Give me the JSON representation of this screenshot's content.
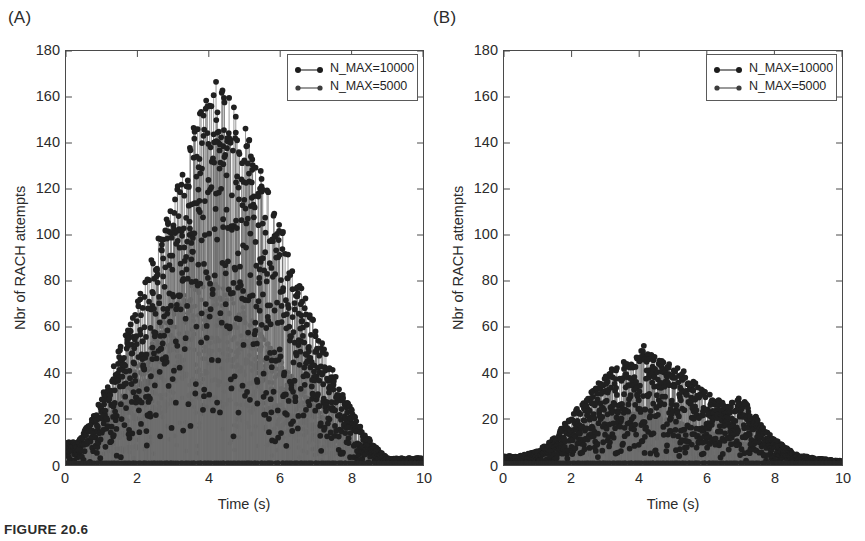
{
  "figure": {
    "caption": "FIGURE 20.6",
    "panels": [
      {
        "id": "a",
        "label": "(A)",
        "xlabel": "Time (s)",
        "ylabel": "Nbr of RACH attempts",
        "xticks": [
          "0",
          "2",
          "4",
          "6",
          "8",
          "10"
        ],
        "yticks": [
          "0",
          "20",
          "40",
          "60",
          "80",
          "100",
          "120",
          "140",
          "160",
          "180"
        ],
        "legend": [
          {
            "label": "N_MAX=10000",
            "marker": "filled-circle",
            "color": "#202020"
          },
          {
            "label": "N_MAX=5000",
            "marker": "filled-circle",
            "color": "#555555"
          }
        ]
      },
      {
        "id": "b",
        "label": "(B)",
        "xlabel": "Time (s)",
        "ylabel": "Nbr of RACH attempts",
        "xticks": [
          "0",
          "2",
          "4",
          "6",
          "8",
          "10"
        ],
        "yticks": [
          "0",
          "20",
          "40",
          "60",
          "80",
          "100",
          "120",
          "140",
          "160",
          "180"
        ],
        "legend": [
          {
            "label": "N_MAX=10000",
            "marker": "filled-circle",
            "color": "#202020"
          },
          {
            "label": "N_MAX=5000",
            "marker": "filled-circle",
            "color": "#555555"
          }
        ]
      }
    ]
  },
  "chart_data": [
    {
      "type": "scatter",
      "panel": "(A)",
      "title": "",
      "subtitle": "",
      "xlabel": "Time (s)",
      "ylabel": "Nbr of RACH attempts",
      "xlim": [
        0,
        10
      ],
      "ylim": [
        0,
        180
      ],
      "xticks": [
        0,
        2,
        4,
        6,
        8,
        10
      ],
      "yticks": [
        0,
        20,
        40,
        60,
        80,
        100,
        120,
        140,
        160,
        180
      ],
      "grid": false,
      "legend_position": "top-right",
      "style": "stem",
      "series": [
        {
          "name": "N_MAX=10000",
          "color": "#202020",
          "marker": "filled-circle",
          "envelope_note": "dense stem cloud, roughly triangular envelope peaking near t=4.2 s",
          "envelope_x": [
            0.3,
            0.8,
            1.2,
            1.6,
            2.0,
            2.4,
            2.8,
            3.2,
            3.6,
            4.0,
            4.2,
            4.6,
            5.0,
            5.4,
            5.8,
            6.2,
            6.6,
            7.0,
            7.4,
            7.8,
            8.2,
            8.6,
            9.0
          ],
          "envelope_y": [
            10,
            22,
            38,
            55,
            72,
            90,
            108,
            128,
            148,
            162,
            168,
            160,
            148,
            132,
            114,
            96,
            78,
            60,
            44,
            30,
            18,
            9,
            3
          ],
          "peak": {
            "x": 4.2,
            "y": 168
          }
        },
        {
          "name": "N_MAX=5000",
          "color": "#555555",
          "marker": "filled-circle",
          "envelope_note": "overlapping lower-amplitude stem cloud inside the N_MAX=10000 envelope",
          "envelope_x": [
            0.4,
            1.0,
            1.5,
            2.0,
            2.5,
            3.0,
            3.5,
            4.0,
            4.4,
            4.8,
            5.2,
            5.6,
            6.0,
            6.5,
            7.0,
            7.5,
            8.0,
            8.5,
            9.0
          ],
          "envelope_y": [
            6,
            16,
            28,
            44,
            58,
            70,
            78,
            80,
            78,
            72,
            64,
            56,
            46,
            36,
            26,
            16,
            10,
            5,
            2
          ],
          "peak": {
            "x": 4.0,
            "y": 80
          }
        }
      ]
    },
    {
      "type": "scatter",
      "panel": "(B)",
      "title": "",
      "subtitle": "",
      "xlabel": "Time (s)",
      "ylabel": "Nbr of RACH attempts",
      "xlim": [
        0,
        10
      ],
      "ylim": [
        0,
        180
      ],
      "xticks": [
        0,
        2,
        4,
        6,
        8,
        10
      ],
      "yticks": [
        0,
        20,
        40,
        60,
        80,
        100,
        120,
        140,
        160,
        180
      ],
      "grid": false,
      "legend_position": "top-right",
      "style": "stem",
      "series": [
        {
          "name": "N_MAX=10000",
          "color": "#202020",
          "marker": "filled-circle",
          "envelope_note": "low broad stem cloud peaking near t=4.2 s at about 53",
          "envelope_x": [
            0.4,
            1.0,
            1.5,
            2.0,
            2.5,
            3.0,
            3.4,
            3.8,
            4.2,
            4.6,
            5.0,
            5.4,
            5.8,
            6.2,
            6.6,
            7.0,
            7.4,
            7.8,
            8.2,
            8.6,
            9.2,
            9.8
          ],
          "envelope_y": [
            4,
            6,
            12,
            22,
            30,
            40,
            44,
            48,
            53,
            46,
            44,
            40,
            34,
            30,
            26,
            30,
            22,
            14,
            9,
            5,
            3,
            2
          ],
          "peak": {
            "x": 4.2,
            "y": 53
          }
        },
        {
          "name": "N_MAX=5000",
          "color": "#555555",
          "marker": "filled-circle",
          "envelope_note": "lower overlapping stem cloud peaking near t=4 s at about 25",
          "envelope_x": [
            0.5,
            1.2,
            1.8,
            2.4,
            3.0,
            3.6,
            4.0,
            4.4,
            5.0,
            5.6,
            6.2,
            6.8,
            7.4,
            8.0,
            8.6,
            9.2,
            9.8
          ],
          "envelope_y": [
            3,
            5,
            10,
            15,
            20,
            23,
            25,
            22,
            20,
            17,
            14,
            11,
            8,
            5,
            3,
            2,
            1
          ],
          "peak": {
            "x": 4.0,
            "y": 25
          }
        }
      ]
    }
  ]
}
